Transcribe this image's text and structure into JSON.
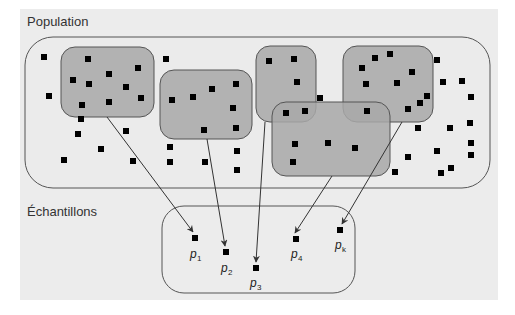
{
  "colors": {
    "page_background": "#ffffff",
    "panel_background": "#ececec",
    "population_fill": "#ebebeb",
    "sample_fill": "#a8a8a8",
    "outline": "#555555",
    "point": "#000000",
    "arrow": "#333333"
  },
  "labels": {
    "population": "Population",
    "samples": "Échantillons"
  },
  "panel": {
    "x": 20,
    "y": 9,
    "w": 478,
    "h": 291
  },
  "population_box": {
    "x": 25,
    "y": 37,
    "w": 465,
    "h": 151,
    "r": 28
  },
  "sample_boxes": [
    {
      "id": "s1",
      "x": 61,
      "y": 47,
      "w": 93,
      "h": 70,
      "r": 14
    },
    {
      "id": "s2",
      "x": 160,
      "y": 70,
      "w": 92,
      "h": 69,
      "r": 14
    },
    {
      "id": "s3",
      "x": 256,
      "y": 46,
      "w": 60,
      "h": 76,
      "r": 14
    },
    {
      "id": "s5",
      "x": 343,
      "y": 46,
      "w": 90,
      "h": 76,
      "r": 14
    },
    {
      "id": "s4",
      "x": 272,
      "y": 102,
      "w": 118,
      "h": 74,
      "r": 14
    }
  ],
  "population_points": [
    [
      44,
      57
    ],
    [
      49,
      96
    ],
    [
      88,
      59
    ],
    [
      138,
      68
    ],
    [
      73,
      80
    ],
    [
      89,
      84
    ],
    [
      109,
      74
    ],
    [
      126,
      87
    ],
    [
      82,
      105
    ],
    [
      109,
      102
    ],
    [
      81,
      119
    ],
    [
      141,
      98
    ],
    [
      166,
      59
    ],
    [
      78,
      134
    ],
    [
      126,
      131
    ],
    [
      64,
      160
    ],
    [
      101,
      149
    ],
    [
      133,
      161
    ],
    [
      172,
      100
    ],
    [
      193,
      97
    ],
    [
      212,
      89
    ],
    [
      236,
      84
    ],
    [
      233,
      108
    ],
    [
      236,
      128
    ],
    [
      204,
      130
    ],
    [
      170,
      147
    ],
    [
      170,
      162
    ],
    [
      205,
      162
    ],
    [
      237,
      151
    ],
    [
      237,
      170
    ],
    [
      269,
      61
    ],
    [
      294,
      59
    ],
    [
      297,
      82
    ],
    [
      286,
      113
    ],
    [
      305,
      111
    ],
    [
      320,
      98
    ],
    [
      295,
      144
    ],
    [
      328,
      143
    ],
    [
      355,
      148
    ],
    [
      293,
      162
    ],
    [
      375,
      58
    ],
    [
      390,
      54
    ],
    [
      362,
      68
    ],
    [
      412,
      72
    ],
    [
      366,
      84
    ],
    [
      397,
      83
    ],
    [
      427,
      96
    ],
    [
      408,
      109
    ],
    [
      367,
      111
    ],
    [
      420,
      103
    ],
    [
      437,
      60
    ],
    [
      443,
      82
    ],
    [
      462,
      81
    ],
    [
      471,
      97
    ],
    [
      418,
      128
    ],
    [
      450,
      128
    ],
    [
      470,
      123
    ],
    [
      408,
      157
    ],
    [
      437,
      151
    ],
    [
      471,
      155
    ],
    [
      471,
      143
    ],
    [
      395,
      172
    ],
    [
      441,
      173
    ],
    [
      451,
      168
    ]
  ],
  "sample_points": [
    {
      "label": "p",
      "sub": "1",
      "x": 195,
      "y": 238,
      "lx": 190,
      "ly": 258
    },
    {
      "label": "p",
      "sub": "2",
      "x": 226,
      "y": 252,
      "lx": 221,
      "ly": 272
    },
    {
      "label": "p",
      "sub": "3",
      "x": 256,
      "y": 268,
      "lx": 250,
      "ly": 287
    },
    {
      "label": "p",
      "sub": "4",
      "x": 296,
      "y": 239,
      "lx": 291,
      "ly": 258
    },
    {
      "label": "p",
      "sub": "k",
      "x": 340,
      "y": 230,
      "lx": 335,
      "ly": 249
    }
  ],
  "arrows": [
    {
      "from": "s1",
      "x1": 107,
      "y1": 117,
      "x2": 193,
      "y2": 232
    },
    {
      "from": "s2",
      "x1": 207,
      "y1": 139,
      "x2": 225,
      "y2": 246
    },
    {
      "from": "s3",
      "x1": 265,
      "y1": 122,
      "x2": 256,
      "y2": 262
    },
    {
      "from": "s4",
      "x1": 332,
      "y1": 176,
      "x2": 295,
      "y2": 233
    },
    {
      "from": "s5",
      "x1": 402,
      "y1": 122,
      "x2": 342,
      "y2": 224
    }
  ]
}
